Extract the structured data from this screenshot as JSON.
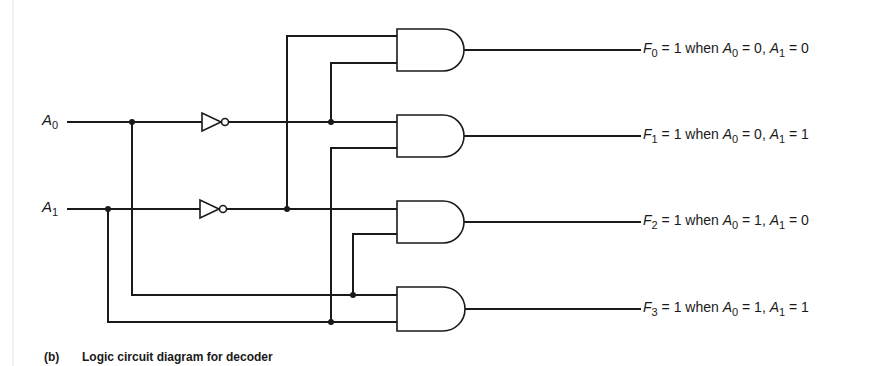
{
  "inputs": [
    {
      "name": "A",
      "sub": "0"
    },
    {
      "name": "A",
      "sub": "1"
    }
  ],
  "outputs": [
    {
      "f": "F",
      "fsub": "0",
      "eq1": "= 1 when",
      "a0": "A",
      "a0sub": "0",
      "v0": "= 0,",
      "a1": "A",
      "a1sub": "1",
      "v1": "= 0"
    },
    {
      "f": "F",
      "fsub": "1",
      "eq1": "= 1 when",
      "a0": "A",
      "a0sub": "0",
      "v0": "= 0,",
      "a1": "A",
      "a1sub": "1",
      "v1": "= 1"
    },
    {
      "f": "F",
      "fsub": "2",
      "eq1": "= 1 when",
      "a0": "A",
      "a0sub": "0",
      "v0": "= 1,",
      "a1": "A",
      "a1sub": "1",
      "v1": "= 0"
    },
    {
      "f": "F",
      "fsub": "3",
      "eq1": "= 1 when",
      "a0": "A",
      "a0sub": "0",
      "v0": "= 1,",
      "a1": "A",
      "a1sub": "1",
      "v1": "= 1"
    }
  ],
  "caption": {
    "tag": "(b)",
    "text": "Logic circuit diagram for decoder"
  },
  "components": {
    "not_gates": 2,
    "and_gates": 4
  }
}
